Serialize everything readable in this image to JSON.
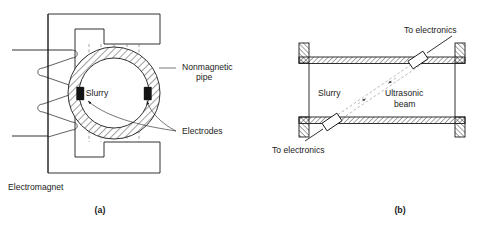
{
  "figure": {
    "panels": [
      {
        "id": "panel-a",
        "caption": "(a)",
        "type": "magnetic-flowmeter",
        "labels": {
          "slurry": "Slurry",
          "pipe_line1": "Nonmagnetic",
          "pipe_line2": "pipe",
          "electrodes": "Electrodes",
          "electromagnet": "Electromagnet"
        }
      },
      {
        "id": "panel-b",
        "caption": "(b)",
        "type": "ultrasonic-flowmeter",
        "labels": {
          "slurry": "Slurry",
          "to_electronics_top": "To electronics",
          "to_electronics_bottom": "To electronics",
          "beam_line1": "Ultrasonic",
          "beam_line2": "beam"
        }
      }
    ],
    "colors": {
      "ink": "#1b1b1b",
      "dash": "#6a6a6a",
      "beam": "#8a8a8a",
      "electrode": "#141414",
      "background": "#ffffff"
    }
  }
}
